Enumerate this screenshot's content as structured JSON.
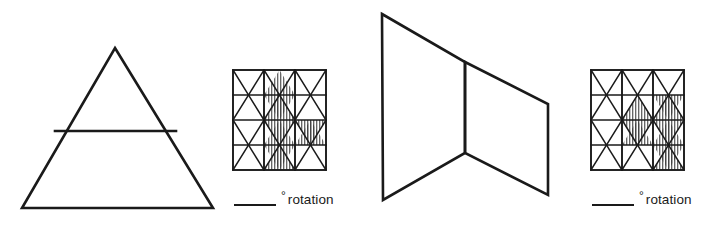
{
  "worksheet": {
    "name": "rotation-identification-worksheet",
    "ink_color": "#1a1a1a",
    "background_color": "#ffffff",
    "hatch_color": "#333333"
  },
  "problems": [
    {
      "id": "problem-1",
      "figure": {
        "name": "triangle-with-horizontal-chord",
        "description": "Isosceles triangle with a horizontal line segment across its interior",
        "apex": [
          115,
          48
        ],
        "base_left": [
          22,
          208
        ],
        "base_right": [
          213,
          208
        ],
        "chord_left": [
          55,
          131
        ],
        "chord_right": [
          175,
          131
        ]
      },
      "grid": {
        "name": "isometric-triangle-grid-1",
        "columns": 3,
        "rows": 4,
        "shaded_cells": [
          "c2r2-down",
          "c2r2-up",
          "c2r3-down",
          "c2r3-up",
          "c3r3-down",
          "c2r4-down"
        ]
      },
      "answer": {
        "blank_label": "",
        "degree_symbol": "°",
        "unit_word": "rotation"
      }
    },
    {
      "id": "problem-2",
      "figure": {
        "name": "folded-quadrilateral-chevron",
        "description": "Two joined quadrilateral panels meeting at a central vertical fold",
        "top_left": [
          382,
          14
        ],
        "fold_top": [
          465,
          62
        ],
        "right_top": [
          548,
          104
        ],
        "right_bottom": [
          548,
          195
        ],
        "fold_bottom": [
          465,
          153
        ],
        "bottom_left": [
          383,
          200
        ]
      },
      "grid": {
        "name": "isometric-triangle-grid-2",
        "columns": 3,
        "rows": 4,
        "shaded_cells": [
          "c2r2-up",
          "c3r2-up",
          "c2r3-down",
          "c3r2-down",
          "c3r3-up",
          "c3r3-down",
          "c3r4-up"
        ]
      },
      "answer": {
        "blank_label": "",
        "degree_symbol": "°",
        "unit_word": "rotation"
      }
    }
  ]
}
